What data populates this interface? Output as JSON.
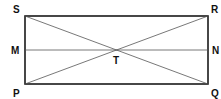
{
  "diagram": {
    "colors": {
      "stroke": "#1a1a1a",
      "thin_stroke": "#555555",
      "label": "#111111",
      "background": "#ffffff"
    },
    "points": {
      "S": {
        "label": "S",
        "x": 25,
        "y": 16
      },
      "R": {
        "label": "R",
        "x": 208,
        "y": 16
      },
      "Q": {
        "label": "Q",
        "x": 208,
        "y": 84
      },
      "P": {
        "label": "P",
        "x": 25,
        "y": 84
      },
      "M": {
        "label": "M",
        "x": 25,
        "y": 50
      },
      "N": {
        "label": "N",
        "x": 208,
        "y": 50
      },
      "T": {
        "label": "T",
        "x": 116.5,
        "y": 50
      }
    },
    "segments": [
      {
        "from": "S",
        "to": "R",
        "kind": "side"
      },
      {
        "from": "R",
        "to": "Q",
        "kind": "side"
      },
      {
        "from": "Q",
        "to": "P",
        "kind": "side"
      },
      {
        "from": "P",
        "to": "S",
        "kind": "side"
      },
      {
        "from": "S",
        "to": "Q",
        "kind": "diagonal"
      },
      {
        "from": "P",
        "to": "R",
        "kind": "diagonal"
      },
      {
        "from": "M",
        "to": "N",
        "kind": "midline"
      }
    ]
  }
}
